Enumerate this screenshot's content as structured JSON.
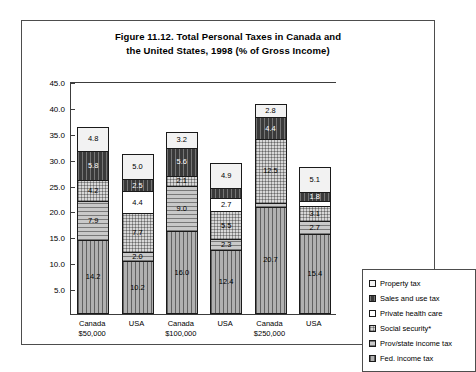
{
  "chart_data": {
    "type": "bar",
    "subtype": "stacked-bar",
    "title": "Figure 11.12. Total Personal Taxes in Canada and the United States, 1998 (% of Gross Income)",
    "title_lines": [
      "Figure 11.12. Total Personal Taxes in Canada and",
      "the United States, 1998 (% of Gross Income)"
    ],
    "xlabel": "",
    "ylabel": "",
    "ylim": [
      0,
      45
    ],
    "grid": false,
    "legend_position": "right-outside",
    "categories": [
      "Canada $50,000",
      "USA $50,000",
      "Canada $100,000",
      "USA $100,000",
      "Canada $250,000",
      "USA $250,000"
    ],
    "category_labels": [
      {
        "line1": "Canada",
        "line2": "$50,000"
      },
      {
        "line1": "USA",
        "line2": ""
      },
      {
        "line1": "Canada",
        "line2": "$100,000"
      },
      {
        "line1": "USA",
        "line2": ""
      },
      {
        "line1": "Canada",
        "line2": "$250,000"
      },
      {
        "line1": "USA",
        "line2": ""
      }
    ],
    "yticks": [
      5.0,
      10.0,
      15.0,
      20.0,
      25.0,
      30.0,
      35.0,
      40.0,
      45.0
    ],
    "ytick_labels": [
      "5.0",
      "10.0",
      "15.0",
      "20.0",
      "25.0",
      "30.0",
      "35.0",
      "40.0",
      "45.0"
    ],
    "series": [
      {
        "name": "Fed. income tax",
        "fill": "fill-fed",
        "values": [
          14.2,
          10.2,
          16.0,
          12.4,
          20.7,
          15.4
        ],
        "labels": [
          "14.2",
          "10.2",
          "16.0",
          "12.4",
          "20.7",
          "15.4"
        ]
      },
      {
        "name": "Prov/state income tax",
        "fill": "fill-prov",
        "values": [
          7.9,
          2.0,
          9.0,
          2.3,
          1.0,
          2.7
        ],
        "labels": [
          "7.9",
          "2.0",
          "9.0",
          "2.3",
          "",
          "2.7"
        ]
      },
      {
        "name": "Social security*",
        "fill": "fill-social",
        "values": [
          4.2,
          7.7,
          2.1,
          5.5,
          12.5,
          3.1
        ],
        "labels": [
          "4.2",
          "7.7",
          "2.1",
          "5.5",
          "12.5",
          "3.1"
        ]
      },
      {
        "name": "Private health care",
        "fill": "fill-health",
        "values": [
          0.0,
          4.4,
          0.0,
          2.7,
          0.0,
          1.3
        ],
        "labels": [
          "",
          "4.4",
          "",
          "2.7",
          "",
          ""
        ]
      },
      {
        "name": "Sales and use tax",
        "fill": "fill-sales",
        "values": [
          5.8,
          2.5,
          5.6,
          2.3,
          4.4,
          1.8
        ],
        "labels": [
          "5.8",
          "2.5",
          "5.6",
          "",
          "4.4",
          "1.8"
        ]
      },
      {
        "name": "Property tax",
        "fill": "fill-property",
        "values": [
          4.8,
          5.0,
          3.2,
          4.9,
          2.8,
          5.1
        ],
        "labels": [
          "4.8",
          "5.0",
          "3.2",
          "4.9",
          "2.8",
          "5.1"
        ]
      }
    ],
    "legend": [
      {
        "label": "Property tax",
        "fill": "fill-property"
      },
      {
        "label": "Sales and use tax",
        "fill": "fill-sales"
      },
      {
        "label": "Private health care",
        "fill": "fill-health"
      },
      {
        "label": "Social security*",
        "fill": "fill-social"
      },
      {
        "label": "Prov/state income tax",
        "fill": "fill-prov"
      },
      {
        "label": "Fed. income tax",
        "fill": "fill-fed"
      }
    ]
  }
}
